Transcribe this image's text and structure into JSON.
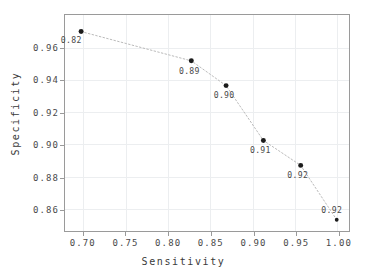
{
  "chart_data": {
    "type": "scatter",
    "title": "",
    "xlabel": "Sensitivity",
    "ylabel": "Specificity",
    "xlim": [
      0.678,
      1.013
    ],
    "ylim": [
      0.8465,
      0.9808
    ],
    "xticks": [
      "0.70",
      "0.75",
      "0.80",
      "0.85",
      "0.90",
      "0.95",
      "1.00"
    ],
    "xtick_values": [
      0.7,
      0.75,
      0.8,
      0.85,
      0.9,
      0.95,
      1.0
    ],
    "yticks": [
      "0.86",
      "0.88",
      "0.90",
      "0.92",
      "0.94",
      "0.96"
    ],
    "ytick_values": [
      0.86,
      0.88,
      0.9,
      0.92,
      0.94,
      0.96
    ],
    "grid": true,
    "legend": null,
    "connector": "dotted-line",
    "points": [
      {
        "x": 0.697,
        "y": 0.9705,
        "label": "0.82",
        "label_dx": -10,
        "label_dy": 12
      },
      {
        "x": 0.827,
        "y": 0.9523,
        "label": "0.89",
        "label_dx": -2,
        "label_dy": 13
      },
      {
        "x": 0.868,
        "y": 0.9369,
        "label": "0.90",
        "label_dx": -2,
        "label_dy": 13
      },
      {
        "x": 0.912,
        "y": 0.9028,
        "label": "0.91",
        "label_dx": -3,
        "label_dy": 13
      },
      {
        "x": 0.956,
        "y": 0.8873,
        "label": "0.92",
        "label_dx": -3,
        "label_dy": 13
      },
      {
        "x": 0.9985,
        "y": 0.8535,
        "label": "0.92",
        "label_dx": -5,
        "label_dy": -7
      }
    ],
    "colors": {
      "marker": "#1b1b1b",
      "connector": "#b9b9b9",
      "grid": "#eceef0",
      "axis": "#9a9a9a",
      "text": "#4a4a4a",
      "background": "#ffffff"
    }
  }
}
